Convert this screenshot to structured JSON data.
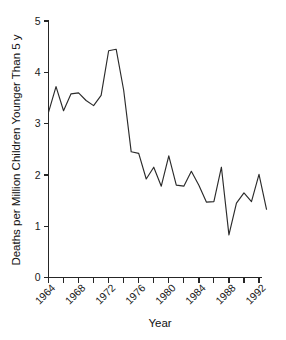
{
  "chart_data": {
    "type": "line",
    "title": "",
    "subtitle": "",
    "xlabel": "Year",
    "ylabel": "Deaths per Million Children Younger Than 5 y",
    "xlim": [
      1964,
      1993
    ],
    "ylim": [
      0,
      5
    ],
    "grid": false,
    "legend": null,
    "legend_position": "none",
    "x_tick_labels": [
      "1964",
      "1968",
      "1972",
      "1976",
      "1980",
      "1984",
      "1988",
      "1992"
    ],
    "x_tick_values": [
      1964,
      1968,
      1972,
      1976,
      1980,
      1984,
      1988,
      1992
    ],
    "x_minor_tick_values": [
      1966,
      1970,
      1974,
      1978,
      1982,
      1986,
      1990
    ],
    "y_tick_labels": [
      "0",
      "1",
      "2",
      "3",
      "4",
      "5"
    ],
    "y_tick_values": [
      0,
      1,
      2,
      3,
      4,
      5
    ],
    "line_color": "#2b2b2b",
    "axis_color": "#262626",
    "background_color": "#ffffff",
    "x": [
      1964,
      1965,
      1966,
      1967,
      1968,
      1969,
      1970,
      1971,
      1972,
      1973,
      1974,
      1975,
      1976,
      1977,
      1978,
      1979,
      1980,
      1981,
      1982,
      1983,
      1984,
      1985,
      1986,
      1987,
      1988,
      1989,
      1990,
      1991,
      1992,
      1993
    ],
    "values": [
      3.22,
      3.72,
      3.25,
      3.58,
      3.6,
      3.45,
      3.35,
      3.55,
      4.42,
      4.45,
      3.65,
      2.45,
      2.42,
      1.92,
      2.15,
      1.78,
      2.37,
      1.8,
      1.78,
      2.07,
      1.8,
      1.47,
      1.48,
      2.15,
      0.83,
      1.45,
      1.65,
      1.48,
      2.01,
      1.33
    ],
    "series": [
      {
        "name": "Deaths per million children younger than 5 y",
        "values": [
          3.22,
          3.72,
          3.25,
          3.58,
          3.6,
          3.45,
          3.35,
          3.55,
          4.42,
          4.45,
          3.65,
          2.45,
          2.42,
          1.92,
          2.15,
          1.78,
          2.37,
          1.8,
          1.78,
          2.07,
          1.8,
          1.47,
          1.48,
          2.15,
          0.83,
          1.45,
          1.65,
          1.48,
          2.01,
          1.33
        ]
      }
    ],
    "annotations": []
  }
}
